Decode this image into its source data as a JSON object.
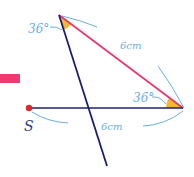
{
  "diagram": {
    "type": "geometry-construction",
    "colors": {
      "dark_line": "#1c1f6e",
      "pink_line": "#e8336b",
      "annotation_blue": "#6aaee0",
      "angle_fill": "#f6b533",
      "point_red": "#e0282c",
      "arrow_pink": "#ee3a6f"
    },
    "labels": {
      "angle_top": "36°",
      "angle_right": "36°",
      "side_pink": "6cm",
      "side_base": "6cm",
      "point_s": "S"
    },
    "points": {
      "top_vertex": [
        59,
        15
      ],
      "right_vertex": [
        183,
        108
      ],
      "s": [
        29,
        108
      ],
      "line_end": [
        107,
        166
      ]
    }
  }
}
